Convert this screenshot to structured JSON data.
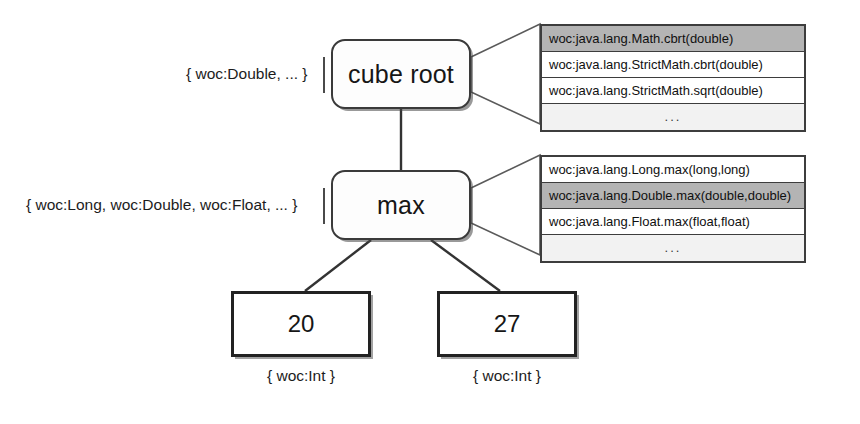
{
  "diagram": {
    "nodes": [
      {
        "id": "cube-root",
        "label": "cube root"
      },
      {
        "id": "max",
        "label": "max"
      }
    ],
    "leaves": [
      {
        "id": "leaf-20",
        "label": "20",
        "typeset": "{ woc:Int }"
      },
      {
        "id": "leaf-27",
        "label": "27",
        "typeset": "{ woc:Int }"
      }
    ],
    "typesets": {
      "cube_root": "{ woc:Double, ... }",
      "max": "{ woc:Long, woc:Double, woc:Float, ... }"
    },
    "candidate_lists": [
      {
        "id": "candidates-cube-root",
        "owner": "cube root",
        "rows": [
          {
            "text": "woc:java.lang.Math.cbrt(double)",
            "selected": true
          },
          {
            "text": "woc:java.lang.StrictMath.cbrt(double)",
            "selected": false
          },
          {
            "text": "woc:java.lang.StrictMath.sqrt(double)",
            "selected": false
          },
          {
            "text": "...",
            "selected": false,
            "ellipsis": true
          }
        ]
      },
      {
        "id": "candidates-max",
        "owner": "max",
        "rows": [
          {
            "text": "woc:java.lang.Long.max(long,long)",
            "selected": false
          },
          {
            "text": "woc:java.lang.Double.max(double,double)",
            "selected": true
          },
          {
            "text": "woc:java.lang.Float.max(float,float)",
            "selected": false
          },
          {
            "text": "...",
            "selected": false,
            "ellipsis": true
          }
        ]
      }
    ],
    "colors": {
      "stroke": "#3d3d3d",
      "selected_row": "#b4b4b4",
      "ellipsis_row": "#f2f2f2",
      "background": "#ffffff"
    }
  }
}
